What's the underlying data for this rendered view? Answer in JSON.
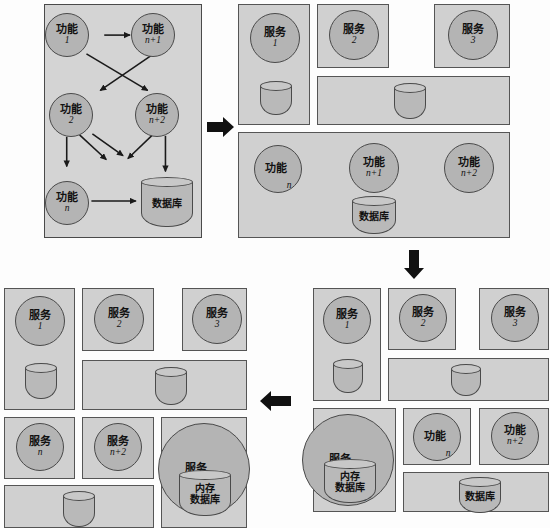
{
  "diagram": {
    "colors": {
      "panel_bg": "#d4d4d4",
      "box_bg": "#d0d0d0",
      "circle_fill": "#b4b4b4",
      "cylinder_fill": "#b9b9b9",
      "stroke": "#4a4a4a",
      "arrow": "#1a1a1a"
    }
  },
  "labels": {
    "gongneng": "功能",
    "fuwu": "服务",
    "shujuku": "数据库",
    "neicun": "内存",
    "neicun_shujuku_line1": "内存",
    "neicun_shujuku_line2": "数据库",
    "n": "n",
    "n1": "n+1",
    "n2": "n+2",
    "one": "1",
    "two": "2",
    "three": "3"
  },
  "stage1": {
    "name": "monolith",
    "nodes": [
      {
        "id": "f1",
        "label": "功能",
        "sub": "1",
        "x": 59,
        "y": 12,
        "d": 44
      },
      {
        "id": "fn1",
        "label": "功能",
        "sub": "n+1",
        "x": 136,
        "y": 12,
        "d": 44
      },
      {
        "id": "f2",
        "label": "功能",
        "sub": "2",
        "x": 59,
        "y": 94,
        "d": 44
      },
      {
        "id": "fn2",
        "label": "功能",
        "sub": "n+2",
        "x": 136,
        "y": 94,
        "d": 44
      },
      {
        "id": "fn",
        "label": "功能",
        "sub": "n",
        "x": 59,
        "y": 182,
        "d": 44
      }
    ],
    "db": {
      "label": "数据库",
      "x": 140,
      "y": 180,
      "w": 52,
      "h": 48
    },
    "edges": [
      {
        "from": "f1",
        "to": "fn1"
      },
      {
        "from": "f1",
        "to": "fn2"
      },
      {
        "from": "fn1",
        "to": "f2"
      },
      {
        "from": "f2",
        "to": "mid"
      },
      {
        "from": "f2",
        "to": "mid2"
      },
      {
        "from": "f2",
        "to": "fn"
      },
      {
        "from": "fn2",
        "to": "midleft"
      },
      {
        "from": "fn2",
        "to": "db"
      },
      {
        "from": "fn",
        "to": "db"
      }
    ]
  },
  "stage2": {
    "name": "services-extracted",
    "services": [
      {
        "label": "服务",
        "sub": "1"
      },
      {
        "label": "服务",
        "sub": "2"
      },
      {
        "label": "服务",
        "sub": "3"
      }
    ],
    "databases": [
      "",
      ""
    ],
    "remaining_functions": [
      {
        "label": "功能",
        "sub": "n",
        "inline": true
      },
      {
        "label": "功能",
        "sub": "n+1",
        "inline": false
      },
      {
        "label": "功能",
        "sub": "n+2",
        "inline": false
      }
    ],
    "remaining_db": "数据库"
  },
  "stage3": {
    "name": "more-services-extracted",
    "services": [
      {
        "label": "服务",
        "sub": "1"
      },
      {
        "label": "服务",
        "sub": "2"
      },
      {
        "label": "服务",
        "sub": "3"
      }
    ],
    "service_memdb": {
      "label": "服务",
      "sub": "n+1",
      "db_line1": "内存",
      "db_line2": "数据库"
    },
    "remaining_functions": [
      {
        "label": "功能",
        "sub": "n",
        "inline": true
      },
      {
        "label": "功能",
        "sub": "n+2",
        "inline": false
      }
    ],
    "remaining_db": "数据库"
  },
  "stage4": {
    "name": "all-microservices",
    "services_row1": [
      {
        "label": "服务",
        "sub": "1"
      },
      {
        "label": "服务",
        "sub": "2"
      },
      {
        "label": "服务",
        "sub": "3"
      }
    ],
    "services_row2": [
      {
        "label": "服务",
        "sub": "n"
      },
      {
        "label": "服务",
        "sub": "n+2"
      }
    ],
    "service_memdb": {
      "label": "服务",
      "sub": "n+1",
      "db_line1": "内存",
      "db_line2": "数据库"
    }
  },
  "arrows": [
    {
      "id": "a1",
      "direction": "right",
      "from": "stage1",
      "to": "stage2"
    },
    {
      "id": "a2",
      "direction": "down",
      "from": "stage2",
      "to": "stage3"
    },
    {
      "id": "a3",
      "direction": "left",
      "from": "stage3",
      "to": "stage4"
    }
  ]
}
